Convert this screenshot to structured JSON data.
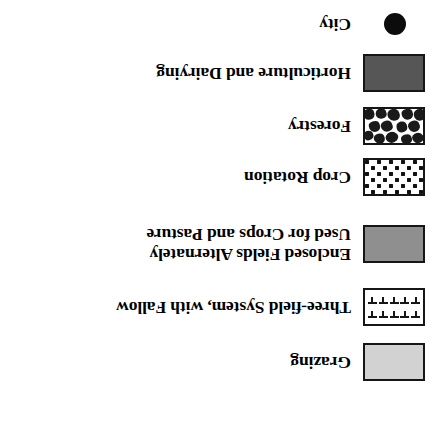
{
  "legend": {
    "orientation": "rotated-180",
    "background_color": "#ffffff",
    "text_color": "#000000",
    "entries": [
      {
        "id": "grazing",
        "label_lines": [
          "Grazing"
        ],
        "symbol": "filled-rectangle-swatch",
        "symbol_name": "light-gray-swatch",
        "fill_color": "#d2d2d2",
        "border_color": "#161616",
        "top": 40
      },
      {
        "id": "three-field-system",
        "label_lines": [
          "Three-field System, with Fallow"
        ],
        "symbol": "patterned-rectangle-swatch",
        "symbol_name": "t-mark-pattern-swatch",
        "fill_color": "#ffffff",
        "border_color": "#161616",
        "top": 95
      },
      {
        "id": "enclosed-fields",
        "label_lines": [
          "Enclosed Fields Alternately",
          "Used for Crops and Pasture"
        ],
        "symbol": "filled-rectangle-swatch",
        "symbol_name": "medium-gray-swatch",
        "fill_color": "#8f8f8f",
        "border_color": "#161616",
        "top": 155
      },
      {
        "id": "crop-rotation",
        "label_lines": [
          "Crop Rotation"
        ],
        "symbol": "patterned-rectangle-swatch",
        "symbol_name": "dot-pattern-swatch",
        "fill_color": "#ffffff",
        "border_color": "#161616",
        "top": 226
      },
      {
        "id": "forestry",
        "label_lines": [
          "Forestry"
        ],
        "symbol": "patterned-rectangle-swatch",
        "symbol_name": "mottled-canopy-swatch",
        "fill_color": "#ffffff",
        "border_color": "#161616",
        "top": 278
      },
      {
        "id": "horticulture-dairying",
        "label_lines": [
          "Horticulture and Dairying"
        ],
        "symbol": "filled-rectangle-swatch",
        "symbol_name": "dark-gray-swatch",
        "fill_color": "#565656",
        "border_color": "#161616",
        "top": 330
      },
      {
        "id": "city",
        "label_lines": [
          "City"
        ],
        "symbol": "filled-circle",
        "symbol_name": "black-dot-symbol",
        "fill_color": "#0c0c0c",
        "border_color": "#0c0c0c",
        "top": 386
      }
    ]
  }
}
